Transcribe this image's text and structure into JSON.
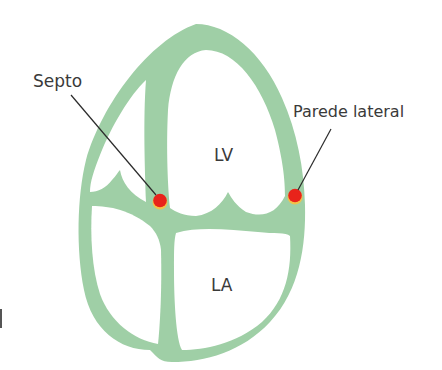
{
  "figure": {
    "type": "anatomical-diagram",
    "colors": {
      "myocardium": "#9fcfa6",
      "marker": "#e8231b",
      "marker_rim": "#f2c14a",
      "leader_line": "#2b2b2b",
      "text": "#3a3a3a",
      "background": "#ffffff"
    }
  },
  "labels": {
    "septum": "Septo",
    "lateral_wall": "Parede lateral",
    "left_ventricle": "LV",
    "left_atrium": "LA"
  },
  "markers": [
    {
      "name": "septum-point",
      "label_ref": "Septo",
      "x": 160,
      "y": 201
    },
    {
      "name": "lateral-wall-point",
      "label_ref": "Parede lateral",
      "x": 295,
      "y": 196
    }
  ]
}
